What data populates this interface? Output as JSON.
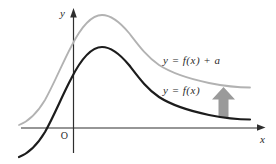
{
  "figure": {
    "type": "function-translation-diagram",
    "background_color": "#ffffff",
    "axes": {
      "x_label": "x",
      "y_label": "y",
      "origin_label": "O",
      "color": "#2e2e2e"
    },
    "curves": {
      "base": {
        "label": "y = f(x)",
        "color": "#1c1c1c"
      },
      "shifted": {
        "label": "y = f(x) + a",
        "color": "#b2b2b2"
      }
    },
    "shift_arrow": {
      "direction": "up",
      "color": "#9a9a9a",
      "meaning": "vertical translation by a"
    },
    "geometry": {
      "curve_path": "M 19,157 C 27,154 36,147 45,132 C 54,116 62,96 71,79 C 80,61 90,47 102,47 C 111,47 119,53 129,65 C 139,78 147,89 159,97 C 173,106 190,111 209,115 C 224,118 238,119.5 250,119.5",
      "shift_transform": "translate(0,-32)",
      "arrow_points": "223.5,87 235,99.5 228.5,99.5 228.5,117 218.5,117 218.5,99.5 212,99.5",
      "x_axis_head_points": "265.5,127.5 257,124.3 257,130.7",
      "y_axis_head_points": "73.5,8 70.2,17.5 76.8,17.5"
    }
  }
}
